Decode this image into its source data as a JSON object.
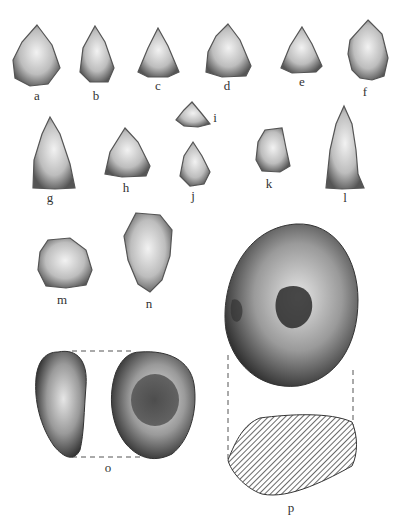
{
  "plate": {
    "title": "",
    "figures": [
      {
        "id": "a",
        "label": "a",
        "type": "projectile-point"
      },
      {
        "id": "b",
        "label": "b",
        "type": "projectile-point"
      },
      {
        "id": "c",
        "label": "c",
        "type": "projectile-point"
      },
      {
        "id": "d",
        "label": "d",
        "type": "projectile-point"
      },
      {
        "id": "e",
        "label": "e",
        "type": "projectile-point"
      },
      {
        "id": "f",
        "label": "f",
        "type": "projectile-point"
      },
      {
        "id": "g",
        "label": "g",
        "type": "projectile-point"
      },
      {
        "id": "h",
        "label": "h",
        "type": "projectile-point"
      },
      {
        "id": "i",
        "label": "i",
        "type": "projectile-point"
      },
      {
        "id": "j",
        "label": "j",
        "type": "projectile-point"
      },
      {
        "id": "k",
        "label": "k",
        "type": "flake"
      },
      {
        "id": "l",
        "label": "l",
        "type": "projectile-point"
      },
      {
        "id": "m",
        "label": "m",
        "type": "flake"
      },
      {
        "id": "n",
        "label": "n",
        "type": "flake"
      },
      {
        "id": "o",
        "label": "o",
        "type": "pitted-stone"
      },
      {
        "id": "p",
        "label": "p",
        "type": "pitted-stone-with-section"
      }
    ]
  }
}
